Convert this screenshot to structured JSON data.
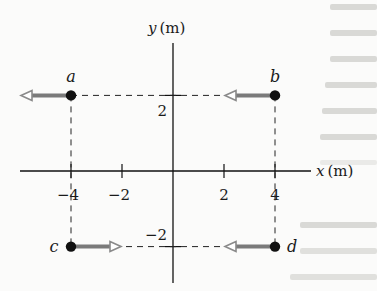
{
  "figure": {
    "x_axis_label_var": "x",
    "x_axis_label_unit": "(m)",
    "y_axis_label_var": "y",
    "y_axis_label_unit": "(m)",
    "x_ticks": [
      {
        "value": -4,
        "label": "−4"
      },
      {
        "value": -2,
        "label": "−2"
      },
      {
        "value": 2,
        "label": "2"
      },
      {
        "value": 4,
        "label": "4"
      }
    ],
    "y_ticks": [
      {
        "value": 2,
        "label": "2"
      },
      {
        "value": -2,
        "label": "−2"
      }
    ],
    "particles": [
      {
        "name": "a",
        "x": -4,
        "y": 2,
        "arrow_direction": "left",
        "arrow_style": "filled-shaft-open-head"
      },
      {
        "name": "b",
        "x": 4,
        "y": 2,
        "arrow_direction": "left",
        "arrow_style": "filled-shaft-open-head"
      },
      {
        "name": "c",
        "x": -4,
        "y": -2,
        "arrow_direction": "right",
        "arrow_style": "filled-shaft-open-head"
      },
      {
        "name": "d",
        "x": 4,
        "y": -2,
        "arrow_direction": "left",
        "arrow_style": "filled-shaft-open-head"
      }
    ],
    "colors": {
      "ink": "#111111",
      "arrow_shaft": "#7a7a7a",
      "arrow_head_stroke": "#8a8a8a",
      "dashed": "#222222"
    }
  }
}
